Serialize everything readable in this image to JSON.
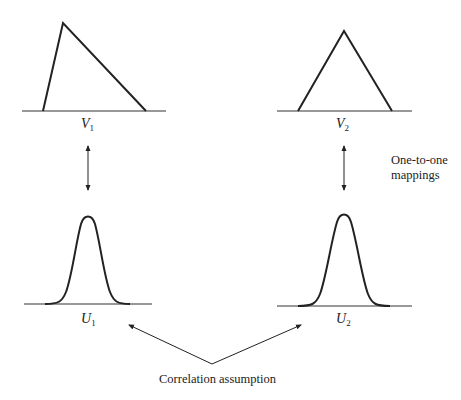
{
  "diagram": {
    "title": "",
    "nodes": [
      {
        "id": "V1",
        "label": "V",
        "subscript": "1",
        "shape": "skewed-triangle-distribution"
      },
      {
        "id": "V2",
        "label": "V",
        "subscript": "2",
        "shape": "symmetric-triangle-distribution"
      },
      {
        "id": "U1",
        "label": "U",
        "subscript": "1",
        "shape": "normal-bell-curve"
      },
      {
        "id": "U2",
        "label": "U",
        "subscript": "2",
        "shape": "normal-bell-curve"
      }
    ],
    "edges": [
      {
        "from": "V1",
        "to": "U1",
        "type": "double-arrow",
        "label": "One-to-one mappings"
      },
      {
        "from": "V2",
        "to": "U2",
        "type": "double-arrow",
        "label": "One-to-one mappings"
      },
      {
        "from": "Correlation assumption",
        "to": "U1",
        "type": "arrow"
      },
      {
        "from": "Correlation assumption",
        "to": "U2",
        "type": "arrow"
      }
    ]
  },
  "labels": {
    "v1": {
      "main": "V",
      "sub": "1"
    },
    "v2": {
      "main": "V",
      "sub": "2"
    },
    "u1": {
      "main": "U",
      "sub": "1"
    },
    "u2": {
      "main": "U",
      "sub": "2"
    },
    "mapping_line1": "One-to-one",
    "mapping_line2": "mappings",
    "correlation": "Correlation assumption"
  },
  "colors": {
    "stroke": "#222222",
    "background": "#ffffff"
  }
}
